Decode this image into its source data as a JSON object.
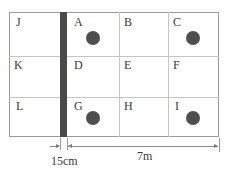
{
  "diagram": {
    "cells": [
      {
        "id": "J",
        "label": "J",
        "has_dot": false
      },
      {
        "id": "A",
        "label": "A",
        "has_dot": true
      },
      {
        "id": "B",
        "label": "B",
        "has_dot": false
      },
      {
        "id": "C",
        "label": "C",
        "has_dot": true
      },
      {
        "id": "K",
        "label": "K",
        "has_dot": false
      },
      {
        "id": "D",
        "label": "D",
        "has_dot": false
      },
      {
        "id": "E",
        "label": "E",
        "has_dot": false
      },
      {
        "id": "F",
        "label": "F",
        "has_dot": false
      },
      {
        "id": "L",
        "label": "L",
        "has_dot": false
      },
      {
        "id": "G",
        "label": "G",
        "has_dot": true
      },
      {
        "id": "H",
        "label": "H",
        "has_dot": false
      },
      {
        "id": "I",
        "label": "I",
        "has_dot": true
      }
    ],
    "dimensions": {
      "wall_thickness": "15cm",
      "room_width": "7m"
    },
    "colors": {
      "wall": "#4a4a4a",
      "dot": "#4f4f4f",
      "grid": "#c4c4c4"
    }
  }
}
